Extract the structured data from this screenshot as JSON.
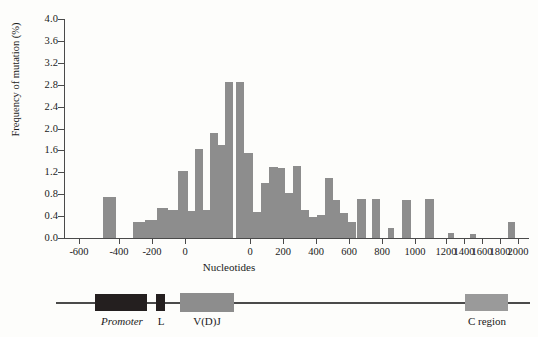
{
  "chart_data": {
    "type": "bar",
    "title": "",
    "xlabel": "Nucleotides",
    "ylabel": "Frequency of mutation (%)",
    "ylim": [
      0.0,
      4.0
    ],
    "grid": false,
    "legend_position": "none",
    "y_ticks": [
      "4.0",
      "3.6",
      "3.2",
      "2.8",
      "2.4",
      "2.0",
      "1.6",
      "1.2",
      "0.8",
      "0.4",
      "0.0"
    ],
    "y_tick_values": [
      4.0,
      3.6,
      3.2,
      2.8,
      2.4,
      2.0,
      1.6,
      1.2,
      0.8,
      0.4,
      0.0
    ],
    "x_ticks": [
      "-600",
      "-400",
      "-200",
      "0",
      "0",
      "200",
      "400",
      "600",
      "800",
      "1000",
      "1200",
      "1400",
      "1600",
      "1800",
      "2000"
    ],
    "x_tick_px": [
      79,
      119,
      152,
      185,
      250,
      283,
      316,
      349,
      382,
      415,
      446,
      464,
      482,
      500,
      518
    ],
    "axis_note": "dual-scale x-axis: upstream/V(D)J coordinates restart at 0 after the V(D)J segment",
    "bar_color": "#8d8d8d",
    "bars": [
      {
        "x_px": 103,
        "width": 13,
        "value": 0.75
      },
      {
        "x_px": 133,
        "width": 12,
        "value": 0.3
      },
      {
        "x_px": 145,
        "width": 12,
        "value": 0.32
      },
      {
        "x_px": 157,
        "width": 11,
        "value": 0.55
      },
      {
        "x_px": 168,
        "width": 10,
        "value": 0.52
      },
      {
        "x_px": 178,
        "width": 10,
        "value": 1.22
      },
      {
        "x_px": 188,
        "width": 7,
        "value": 0.5
      },
      {
        "x_px": 195,
        "width": 8,
        "value": 1.62
      },
      {
        "x_px": 203,
        "width": 7,
        "value": 0.52
      },
      {
        "x_px": 210,
        "width": 8,
        "value": 1.92
      },
      {
        "x_px": 218,
        "width": 7,
        "value": 1.7
      },
      {
        "x_px": 225,
        "width": 8,
        "value": 2.85
      },
      {
        "x_px": 236,
        "width": 8,
        "value": 2.85
      },
      {
        "x_px": 244,
        "width": 9,
        "value": 1.55
      },
      {
        "x_px": 253,
        "width": 8,
        "value": 0.48
      },
      {
        "x_px": 261,
        "width": 8,
        "value": 1.0
      },
      {
        "x_px": 269,
        "width": 9,
        "value": 1.3
      },
      {
        "x_px": 278,
        "width": 7,
        "value": 1.28
      },
      {
        "x_px": 285,
        "width": 8,
        "value": 0.82
      },
      {
        "x_px": 293,
        "width": 8,
        "value": 1.32
      },
      {
        "x_px": 301,
        "width": 8,
        "value": 0.52
      },
      {
        "x_px": 309,
        "width": 8,
        "value": 0.38
      },
      {
        "x_px": 317,
        "width": 8,
        "value": 0.42
      },
      {
        "x_px": 325,
        "width": 8,
        "value": 1.1
      },
      {
        "x_px": 333,
        "width": 7,
        "value": 0.7
      },
      {
        "x_px": 340,
        "width": 8,
        "value": 0.45
      },
      {
        "x_px": 348,
        "width": 8,
        "value": 0.3
      },
      {
        "x_px": 357,
        "width": 9,
        "value": 0.72
      },
      {
        "x_px": 372,
        "width": 8,
        "value": 0.72
      },
      {
        "x_px": 388,
        "width": 6,
        "value": 0.18
      },
      {
        "x_px": 402,
        "width": 9,
        "value": 0.7
      },
      {
        "x_px": 425,
        "width": 9,
        "value": 0.72
      },
      {
        "x_px": 448,
        "width": 6,
        "value": 0.1
      },
      {
        "x_px": 470,
        "width": 6,
        "value": 0.08
      },
      {
        "x_px": 508,
        "width": 7,
        "value": 0.3
      }
    ]
  },
  "gene_map": {
    "elements": [
      {
        "name": "promoter",
        "label": "Promoter",
        "italic": true,
        "left": 95,
        "width": 52,
        "height": 17,
        "color": "#241f1f",
        "label_center": 122
      },
      {
        "name": "leader",
        "label": "L",
        "italic": false,
        "left": 156,
        "width": 9,
        "height": 17,
        "color": "#241f1f",
        "label_center": 161
      },
      {
        "name": "vdj",
        "label": "V(D)J",
        "italic": false,
        "left": 180,
        "width": 54,
        "height": 19,
        "color": "#8d8d8d",
        "label_center": 207
      },
      {
        "name": "c-region",
        "label": "C region",
        "italic": false,
        "left": 465,
        "width": 43,
        "height": 17,
        "color": "#9a9a9a",
        "label_center": 487
      }
    ]
  }
}
